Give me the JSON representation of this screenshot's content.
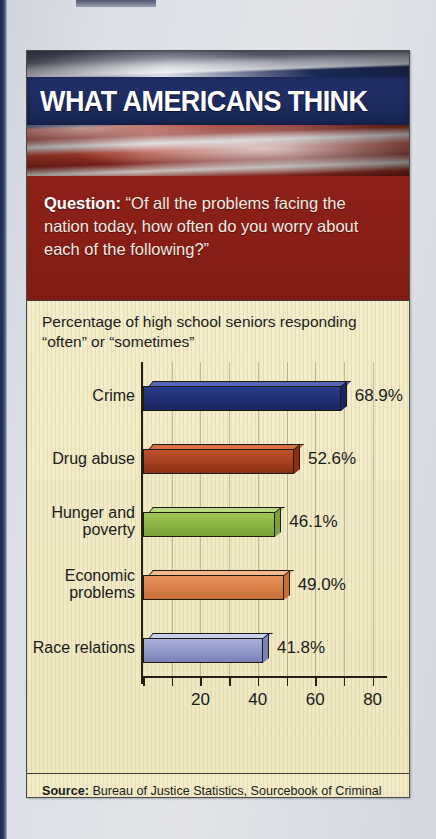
{
  "header": {
    "title": "WHAT AMERICANS THINK",
    "flag_image": "american-flag-photo"
  },
  "question": {
    "label": "Question:",
    "text": "“Of all the problems facing the nation today, how often do you worry about each of the following?”"
  },
  "chart_subtitle": "Percentage of high school seniors responding “often” or “sometimes”",
  "source": {
    "label": "Source:",
    "text": "Bureau of Justice Statistics, Sourcebook of Criminal Justice Statistics, 2003 (Washington, DC: U.S. Government Printing Office, 2004), Table 2.70."
  },
  "colors": {
    "banner_navy": "#1e2c61",
    "question_red": "#8a1f17",
    "panel_cream": "#f2ebc6",
    "bar_crime": "#2b3b8c",
    "bar_drug": "#c0512a",
    "bar_hunger": "#9dc653",
    "bar_economic": "#e8935a",
    "bar_race": "#a9b0da"
  },
  "chart_data": {
    "type": "bar",
    "orientation": "horizontal",
    "title": "Percentage of high school seniors responding “often” or “sometimes”",
    "xlabel": "",
    "ylabel": "",
    "xlim": [
      0,
      90
    ],
    "grid": true,
    "legend": "none",
    "categories": [
      "Crime",
      "Drug abuse",
      "Hunger and poverty",
      "Economic problems",
      "Race relations"
    ],
    "values": [
      68.9,
      52.6,
      46.1,
      49.0,
      41.8
    ],
    "value_labels": [
      "68.9%",
      "52.6%",
      "46.1%",
      "49.0%",
      "41.8%"
    ],
    "bar_colors": [
      "#2b3b8c",
      "#c0512a",
      "#9dc653",
      "#e8935a",
      "#a9b0da"
    ],
    "bar_top_colors": [
      "#5566b8",
      "#d9703f",
      "#b9d97c",
      "#f3b98c",
      "#c9cfee"
    ],
    "bar_side_colors": [
      "#1a2460",
      "#8b3014",
      "#7ba23a",
      "#c76f35",
      "#7a83b5"
    ],
    "xticks": [
      0,
      10,
      20,
      30,
      40,
      50,
      60,
      70,
      80
    ],
    "xtick_labels": [
      "",
      "",
      "20",
      "",
      "40",
      "",
      "60",
      "",
      "80"
    ]
  }
}
